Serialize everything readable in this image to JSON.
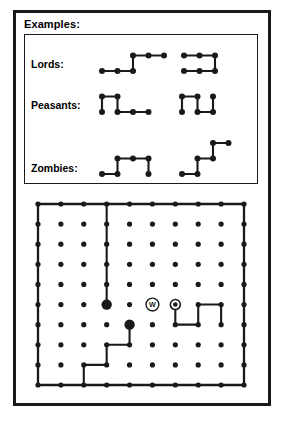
{
  "figure": {
    "title": "Examples:",
    "caption": ""
  },
  "legend": {
    "rows": [
      {
        "label": "Lords:",
        "name": "lords",
        "shapes": [
          {
            "name": "lords-shape-left",
            "points": [
              [
                0,
                1
              ],
              [
                1,
                1
              ],
              [
                2,
                1
              ],
              [
                2,
                0
              ],
              [
                3,
                0
              ],
              [
                4,
                0
              ]
            ],
            "path": "M0,1 L2,1 L2,0 L4,0"
          },
          {
            "name": "lords-shape-right",
            "points": [
              [
                0,
                0
              ],
              [
                1,
                0
              ],
              [
                2,
                0
              ],
              [
                2,
                1
              ],
              [
                1,
                1
              ],
              [
                0,
                1
              ]
            ],
            "path": "M0,0 L2,0 L2,1 L0,1"
          }
        ]
      },
      {
        "label": "Peasants:",
        "name": "peasants",
        "shapes": [
          {
            "name": "peasants-shape-left",
            "points": [
              [
                0,
                1
              ],
              [
                0,
                0
              ],
              [
                1,
                0
              ],
              [
                1,
                1
              ],
              [
                2,
                1
              ],
              [
                3,
                1
              ]
            ],
            "path": "M0,1 L0,0 L1,0 L1,1 L3,1"
          },
          {
            "name": "peasants-shape-right",
            "points": [
              [
                0,
                1
              ],
              [
                0,
                0
              ],
              [
                1,
                0
              ],
              [
                1,
                1
              ],
              [
                2,
                1
              ],
              [
                2,
                0
              ]
            ],
            "path": "M0,1 L0,0 L1,0 L1,1 L2,1 L2,0"
          }
        ]
      },
      {
        "label": "Zombies:",
        "name": "zombies",
        "shapes": [
          {
            "name": "zombies-shape-left",
            "points": [
              [
                0,
                2
              ],
              [
                1,
                2
              ],
              [
                1,
                1
              ],
              [
                2,
                1
              ],
              [
                3,
                1
              ],
              [
                3,
                2
              ]
            ],
            "path": "M0,2 L1,2 L1,1 L3,1 L3,2"
          },
          {
            "name": "zombies-shape-right",
            "points": [
              [
                0,
                2
              ],
              [
                1,
                2
              ],
              [
                1,
                1
              ],
              [
                2,
                1
              ],
              [
                2,
                0
              ],
              [
                3,
                0
              ]
            ],
            "path": "M0,2 L1,2 L1,1 L2,1 L2,0 L3,0"
          }
        ]
      }
    ]
  },
  "grid": {
    "cols": 10,
    "rows": 10,
    "dot_radius": 2.6,
    "boundary_path": "M0,0 L9,0 L9,9 L0,9 Z",
    "interior_paths": [
      {
        "name": "column-path-to-node",
        "path": "M3,0 L3,5"
      },
      {
        "name": "staircase-path-bottom-left",
        "path": "M4,6 L4,7 L3,7 L3,8 L2,8 L2,9"
      },
      {
        "name": "right-loop-path",
        "path": "M6,5 L6,6 L7,6 L7,5 L8,5 L8,6"
      }
    ],
    "big_dots": [
      {
        "name": "big-dot-left",
        "col": 3,
        "row": 5,
        "radius": 5.2
      },
      {
        "name": "big-dot-center",
        "col": 4,
        "row": 6,
        "radius": 5.2
      }
    ],
    "markers": [
      {
        "name": "marker-w",
        "label": "W",
        "col": 5,
        "row": 5,
        "style": "circled-letter",
        "radius": 6.4
      },
      {
        "name": "marker-ring",
        "label": "",
        "col": 6,
        "row": 5,
        "style": "ringed-dot",
        "radius": 5.0
      }
    ]
  },
  "colors": {
    "ink": "#1a1a1a",
    "background": "#ffffff"
  }
}
